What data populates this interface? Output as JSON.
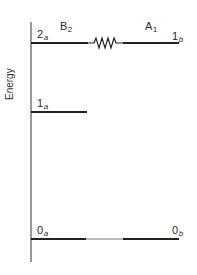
{
  "diagram": {
    "type": "energy-level-diagram",
    "axis_label": "Energy",
    "symmetry_labels": {
      "left": {
        "main": "B",
        "sub": "2"
      },
      "right": {
        "main": "A",
        "sub": "1"
      }
    },
    "levels": [
      {
        "id": "2a",
        "label_main": "2",
        "label_sub": "a",
        "side": "left",
        "y": 43
      },
      {
        "id": "1b",
        "label_main": "1",
        "label_sub": "b",
        "side": "right",
        "y": 43
      },
      {
        "id": "1a",
        "label_main": "1",
        "label_sub": "a",
        "side": "left",
        "y": 112
      },
      {
        "id": "0a",
        "label_main": "0",
        "label_sub": "a",
        "side": "left",
        "y": 239
      },
      {
        "id": "0b",
        "label_main": "0",
        "label_sub": "b",
        "side": "right",
        "y": 239
      }
    ],
    "coupling": {
      "between": [
        "2a",
        "1b"
      ],
      "style": "zigzag"
    },
    "colors": {
      "line": "#222222",
      "axis": "#555555",
      "thin_link": "#777777"
    }
  }
}
